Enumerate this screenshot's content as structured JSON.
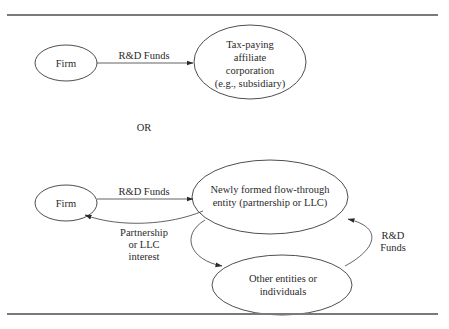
{
  "diagram_top": {
    "firm": {
      "label": "Firm"
    },
    "edge_firm_to_affiliate": {
      "label": "R&D Funds"
    },
    "affiliate": {
      "lines": [
        "Tax-paying",
        "affiliate",
        "corporation",
        "(e.g., subsidiary)"
      ]
    }
  },
  "separator": {
    "label": "OR"
  },
  "diagram_bottom": {
    "firm": {
      "label": "Firm"
    },
    "edge_firm_to_entity": {
      "label": "R&D Funds"
    },
    "flow_through_entity": {
      "lines": [
        "Newly formed flow-through",
        "entity (partnership or LLC)"
      ]
    },
    "edge_entity_to_firm": {
      "lines": [
        "Partnership",
        "or LLC",
        "interest"
      ]
    },
    "other_entities": {
      "lines": [
        "Other entities or",
        "individuals"
      ]
    },
    "edge_other_to_entity": {
      "lines": [
        "R&D",
        "Funds"
      ]
    }
  }
}
